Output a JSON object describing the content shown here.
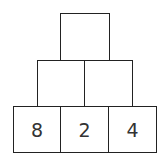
{
  "pyramid": {
    "top": [
      ""
    ],
    "middle": [
      "",
      ""
    ],
    "bottom": [
      "8",
      "2",
      "4"
    ]
  }
}
